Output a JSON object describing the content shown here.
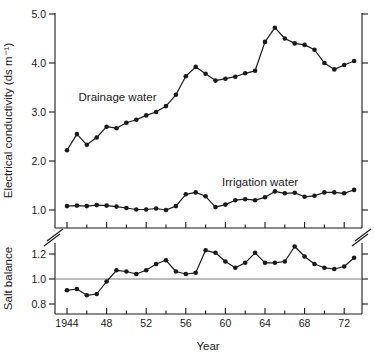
{
  "figure": {
    "xlabel": "Year",
    "top_ylabel": "Electrical conductivity (ds m⁻¹)",
    "bottom_ylabel": "Salt balance"
  },
  "chart_data": {
    "type": "line",
    "xlabel": "Year",
    "x": [
      1944,
      1945,
      1946,
      1947,
      1948,
      1949,
      1950,
      1951,
      1952,
      1953,
      1954,
      1955,
      1956,
      1957,
      1958,
      1959,
      1960,
      1961,
      1962,
      1963,
      1964,
      1965,
      1966,
      1967,
      1968,
      1969,
      1970,
      1971,
      1972,
      1973
    ],
    "xticks": [
      {
        "year": 1944,
        "label": "1944"
      },
      {
        "year": 1946
      },
      {
        "year": 1948,
        "label": "48"
      },
      {
        "year": 1950
      },
      {
        "year": 1952,
        "label": "52"
      },
      {
        "year": 1954
      },
      {
        "year": 1956,
        "label": "56"
      },
      {
        "year": 1958
      },
      {
        "year": 1960,
        "label": "60"
      },
      {
        "year": 1962
      },
      {
        "year": 1964,
        "label": "64"
      },
      {
        "year": 1966
      },
      {
        "year": 1968,
        "label": "68"
      },
      {
        "year": 1970
      },
      {
        "year": 1972,
        "label": "72"
      }
    ],
    "axis_break_between_panels": true,
    "grid": false,
    "legend": "inline-text-labels",
    "colors": {
      "line": "#1a1a1a",
      "ref_line": "#7a7a7a",
      "background": "#ffffff"
    },
    "panels": [
      {
        "id": "electrical-conductivity",
        "ylabel": "Electrical conductivity (ds m⁻¹)",
        "yticks": [
          1.0,
          2.0,
          3.0,
          4.0,
          5.0
        ],
        "ylim": [
          0.6,
          5.0
        ],
        "series": [
          {
            "name": "Drainage water",
            "label_pos": {
              "year": 1949.1,
              "value": 3.22
            },
            "values": [
              2.22,
              2.55,
              2.33,
              2.48,
              2.7,
              2.67,
              2.78,
              2.84,
              2.93,
              3.0,
              3.12,
              3.35,
              3.73,
              3.92,
              3.78,
              3.64,
              3.68,
              3.72,
              3.79,
              3.84,
              4.43,
              4.72,
              4.5,
              4.4,
              4.37,
              4.27,
              4.0,
              3.87,
              3.96,
              4.04
            ]
          },
          {
            "name": "Irrigation water",
            "label_pos": {
              "year": 1963.5,
              "value": 1.49
            },
            "values": [
              1.08,
              1.09,
              1.08,
              1.1,
              1.09,
              1.07,
              1.04,
              1.01,
              1.01,
              1.03,
              1.0,
              1.08,
              1.32,
              1.36,
              1.28,
              1.06,
              1.11,
              1.2,
              1.22,
              1.2,
              1.26,
              1.38,
              1.34,
              1.35,
              1.27,
              1.29,
              1.36,
              1.36,
              1.34,
              1.41
            ]
          }
        ]
      },
      {
        "id": "salt-balance",
        "ylabel": "Salt balance",
        "yticks": [
          0.8,
          1.0,
          1.2
        ],
        "ylim": [
          0.72,
          1.29
        ],
        "ref_line": 1.0,
        "series": [
          {
            "name": "Salt balance",
            "values": [
              0.91,
              0.92,
              0.87,
              0.88,
              0.98,
              1.07,
              1.06,
              1.04,
              1.07,
              1.12,
              1.15,
              1.06,
              1.04,
              1.05,
              1.23,
              1.21,
              1.14,
              1.09,
              1.13,
              1.21,
              1.13,
              1.13,
              1.14,
              1.26,
              1.18,
              1.12,
              1.09,
              1.08,
              1.1,
              1.17
            ]
          }
        ]
      }
    ]
  }
}
